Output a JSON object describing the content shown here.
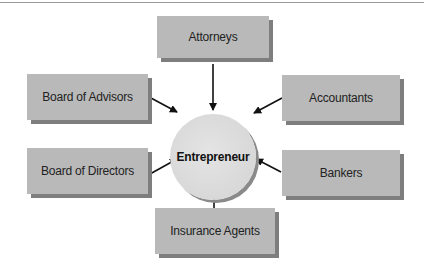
{
  "diagram": {
    "center": {
      "label": "Entrepreneur"
    },
    "nodes": [
      {
        "id": "attorneys",
        "label": "Attorneys"
      },
      {
        "id": "board-of-advisors",
        "label": "Board of Advisors"
      },
      {
        "id": "accountants",
        "label": "Accountants"
      },
      {
        "id": "board-of-directors",
        "label": "Board of Directors"
      },
      {
        "id": "bankers",
        "label": "Bankers"
      },
      {
        "id": "insurance-agents",
        "label": "Insurance Agents"
      }
    ],
    "edges": [
      {
        "from": "attorneys",
        "to": "entrepreneur"
      },
      {
        "from": "board-of-advisors",
        "to": "entrepreneur"
      },
      {
        "from": "accountants",
        "to": "entrepreneur"
      },
      {
        "from": "board-of-directors",
        "to": "entrepreneur"
      },
      {
        "from": "bankers",
        "to": "entrepreneur"
      },
      {
        "from": "insurance-agents",
        "to": "entrepreneur"
      }
    ]
  }
}
